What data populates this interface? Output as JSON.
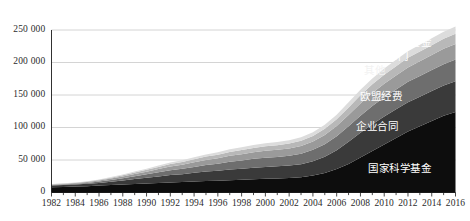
{
  "chart_data": {
    "type": "area",
    "stacked": true,
    "title": "",
    "subtitle": "",
    "xlabel": "",
    "ylabel": "",
    "grid": true,
    "legend_position": "inline-right",
    "xlim": [
      1982,
      2016
    ],
    "ylim": [
      0,
      250000
    ],
    "y_ticks": [
      0,
      50000,
      100000,
      150000,
      200000,
      250000
    ],
    "y_tick_labels": [
      "0",
      "50 000",
      "100 000",
      "150 000",
      "200 000",
      "250 000"
    ],
    "x_ticks": [
      1982,
      1984,
      1986,
      1988,
      1990,
      1992,
      1994,
      1996,
      1998,
      2000,
      2002,
      2004,
      2006,
      2008,
      2010,
      2012,
      2014,
      2016
    ],
    "x_tick_labels": [
      "1982",
      "1984",
      "1986",
      "1988",
      "1990",
      "1992",
      "1994",
      "1996",
      "1998",
      "2000",
      "2002",
      "2004",
      "2006",
      "2008",
      "2010",
      "2012",
      "2014",
      "2016"
    ],
    "x_minor_tick_interval": 1,
    "x": [
      1982,
      1983,
      1984,
      1985,
      1986,
      1987,
      1988,
      1989,
      1990,
      1991,
      1992,
      1993,
      1994,
      1995,
      1996,
      1997,
      1998,
      1999,
      2000,
      2001,
      2002,
      2003,
      2004,
      2005,
      2006,
      2007,
      2008,
      2009,
      2010,
      2011,
      2012,
      2013,
      2014,
      2015,
      2016
    ],
    "series": [
      {
        "name": "国家科学基金",
        "color": "#0d0d0d",
        "label_color": "#ffffff",
        "values": [
          8000,
          8600,
          9200,
          9800,
          10600,
          11400,
          12200,
          13000,
          13800,
          14600,
          15400,
          16000,
          16800,
          17600,
          18200,
          19000,
          19600,
          20400,
          21000,
          21600,
          22400,
          23600,
          26000,
          30000,
          36000,
          44000,
          54000,
          64000,
          74000,
          84000,
          94000,
          102000,
          110000,
          118000,
          124000
        ]
      },
      {
        "name": "企业合同",
        "color": "#3a3a3a",
        "label_color": "#ffffff",
        "values": [
          2600,
          2800,
          3100,
          3500,
          4200,
          5200,
          6400,
          7600,
          8800,
          10200,
          11400,
          12200,
          13400,
          14600,
          15200,
          16400,
          17000,
          17800,
          18400,
          18600,
          19000,
          20000,
          22000,
          25000,
          29000,
          34000,
          38000,
          41000,
          43000,
          44000,
          45000,
          45500,
          46000,
          46500,
          47000
        ]
      },
      {
        "name": "欧盟经费",
        "color": "#6e6e6e",
        "label_color": "#ffffff",
        "values": [
          900,
          1000,
          1200,
          1500,
          2000,
          2700,
          3500,
          4400,
          5400,
          6400,
          7400,
          8200,
          9200,
          10200,
          11000,
          12000,
          12800,
          13600,
          14200,
          14600,
          15200,
          16200,
          17600,
          19400,
          21600,
          24000,
          26200,
          28000,
          29400,
          30400,
          31200,
          31800,
          32400,
          33000,
          33600
        ]
      },
      {
        "name": "其他",
        "color": "#9a9a9a",
        "label_color": "#f2f2f2",
        "values": [
          700,
          800,
          950,
          1200,
          1600,
          2100,
          2700,
          3400,
          4100,
          4900,
          5700,
          6300,
          7000,
          7700,
          8300,
          9000,
          9500,
          10100,
          10500,
          10800,
          11200,
          11900,
          12900,
          14200,
          15700,
          17400,
          18900,
          20100,
          21000,
          21700,
          22300,
          22700,
          23100,
          23500,
          23900
        ]
      },
      {
        "name": "公共部门",
        "color": "#b8b8b8",
        "label_color": "#ffffff",
        "values": [
          500,
          560,
          650,
          800,
          1050,
          1400,
          1800,
          2250,
          2750,
          3250,
          3800,
          4200,
          4650,
          5100,
          5500,
          5950,
          6300,
          6700,
          6950,
          7150,
          7400,
          7850,
          8500,
          9350,
          10350,
          11450,
          12450,
          13250,
          13850,
          14300,
          14700,
          14950,
          15200,
          15450,
          15700
        ]
      },
      {
        "name": "科技创新基金",
        "color": "#dcdcdc",
        "label_color": "#ffffff",
        "values": [
          300,
          340,
          400,
          500,
          680,
          900,
          1180,
          1480,
          1800,
          2150,
          2500,
          2800,
          3100,
          3400,
          3700,
          4000,
          4250,
          4500,
          4700,
          4850,
          5050,
          5350,
          5800,
          6400,
          7100,
          7850,
          8550,
          9100,
          9550,
          9900,
          10200,
          10400,
          10600,
          10800,
          11000
        ]
      }
    ]
  },
  "axis": {
    "axis_line_color": "#1a1a1a",
    "grid_color": "#cfcfcf",
    "tick_label_color": "#2b2b2b"
  },
  "labels": {
    "s0": "国家科学基金",
    "s1": "企业合同",
    "s2": "欧盟经费",
    "s3": "其他",
    "s4": "公共部门",
    "s5": "科技创新基金"
  }
}
